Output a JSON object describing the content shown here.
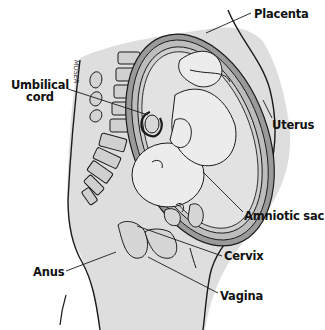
{
  "diagram": {
    "colors": {
      "background": "#ffffff",
      "skin": "#dcdcdc",
      "uterus_wall": "#9a9a9a",
      "amniotic": "#c8c8c8",
      "fetus": "#e4e4e4",
      "line": "#1a1a1a",
      "text": "#111111"
    },
    "labels": [
      {
        "id": "placenta",
        "text": "Placenta"
      },
      {
        "id": "umbilical-cord",
        "line1": "Umbilical",
        "line2": "cord"
      },
      {
        "id": "uterus",
        "text": "Uterus"
      },
      {
        "id": "amniotic-sac",
        "text": "Amniotic sac"
      },
      {
        "id": "cervix",
        "text": "Cervix"
      },
      {
        "id": "anus",
        "text": "Anus"
      },
      {
        "id": "vagina",
        "text": "Vagina"
      }
    ],
    "signature": "MOSER"
  }
}
